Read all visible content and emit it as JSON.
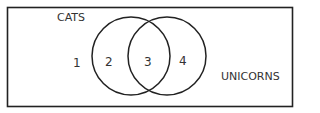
{
  "diagram": {
    "type": "venn",
    "universe_label": "",
    "sets": [
      {
        "name": "CATS"
      },
      {
        "name": "UNICORNS"
      }
    ],
    "region_labels": {
      "outside": "1",
      "cats_only": "2",
      "intersection": "3",
      "unicorns_only": "4"
    },
    "colors": {
      "stroke": "#222222",
      "text": "#333333",
      "background": "#ffffff"
    }
  }
}
